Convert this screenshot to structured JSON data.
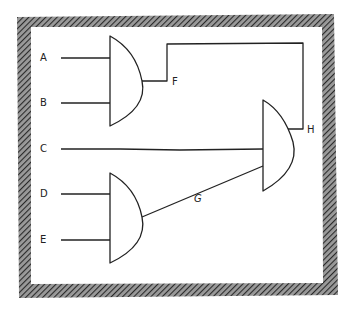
{
  "diagram": {
    "type": "logic-circuit",
    "frame_style": "hand-drawn hatched border",
    "inputs": [
      {
        "id": "A",
        "label": "A",
        "x": 40,
        "y": 56
      },
      {
        "id": "B",
        "label": "B",
        "x": 40,
        "y": 100
      },
      {
        "id": "C",
        "label": "C",
        "x": 40,
        "y": 146
      },
      {
        "id": "D",
        "label": "D",
        "x": 40,
        "y": 191
      },
      {
        "id": "E",
        "label": "E",
        "x": 40,
        "y": 236
      }
    ],
    "gates": [
      {
        "id": "gate-1",
        "type": "AND",
        "inputs": [
          "A",
          "B"
        ],
        "output": "F"
      },
      {
        "id": "gate-2",
        "type": "AND",
        "inputs": [
          "D",
          "E"
        ],
        "output": "G"
      },
      {
        "id": "gate-3",
        "type": "AND",
        "inputs": [
          "F",
          "C",
          "G"
        ],
        "output": "H"
      }
    ],
    "signal_labels": [
      {
        "id": "F",
        "label": "F",
        "x": 172,
        "y": 77
      },
      {
        "id": "G",
        "label": "G",
        "x": 194,
        "y": 194
      },
      {
        "id": "H",
        "label": "H",
        "x": 307,
        "y": 125
      }
    ],
    "colors": {
      "stroke": "#222222",
      "hatch": "#444444",
      "background": "#ffffff"
    }
  }
}
